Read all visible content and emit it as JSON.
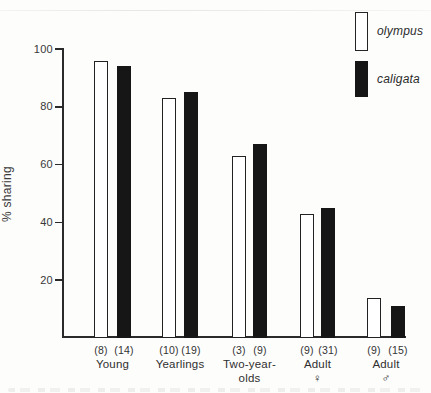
{
  "figure": {
    "ylabel": "% sharing"
  },
  "legend": {
    "items": [
      {
        "label": "olympus",
        "swatch": "white-outlined"
      },
      {
        "label": "caligata",
        "swatch": "black-filled"
      }
    ]
  },
  "chart_data": {
    "type": "bar",
    "title": "",
    "xlabel": "",
    "ylabel": "% sharing",
    "ylim": [
      0,
      100
    ],
    "yticks": [
      20,
      40,
      60,
      80,
      100
    ],
    "grid": false,
    "legend_position": "top-right",
    "categories": [
      "Young",
      "Yearlings",
      "Two-year-olds",
      "Adult ♀",
      "Adult ♂"
    ],
    "category_label_lines": [
      [
        "Young"
      ],
      [
        "Yearlings"
      ],
      [
        "Two-year-",
        "olds"
      ],
      [
        "Adult",
        "♀"
      ],
      [
        "Adult",
        "♂"
      ]
    ],
    "series": [
      {
        "name": "olympus",
        "fill": "#ffffff",
        "outline": "#222222",
        "values": [
          96,
          83,
          63,
          43,
          14
        ],
        "sample_sizes": [
          8,
          10,
          3,
          9,
          9
        ]
      },
      {
        "name": "caligata",
        "fill": "#161616",
        "outline": "#161616",
        "values": [
          94,
          85,
          67,
          45,
          11
        ],
        "sample_sizes": [
          14,
          19,
          9,
          31,
          15
        ]
      }
    ]
  }
}
